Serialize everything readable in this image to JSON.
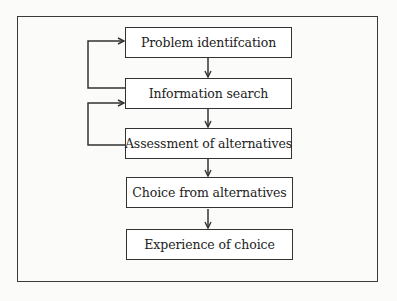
{
  "diagram": {
    "type": "flowchart",
    "steps": [
      {
        "label": "Problem identifcation"
      },
      {
        "label": "Information search"
      },
      {
        "label": "Assessment of alternatives"
      },
      {
        "label": "Choice from alternatives"
      },
      {
        "label": "Experience of choice"
      }
    ],
    "connections": [
      {
        "from": 0,
        "to": 1,
        "type": "forward"
      },
      {
        "from": 1,
        "to": 2,
        "type": "forward"
      },
      {
        "from": 2,
        "to": 3,
        "type": "forward"
      },
      {
        "from": 3,
        "to": 4,
        "type": "forward"
      },
      {
        "from": 1,
        "to": 0,
        "type": "feedback"
      },
      {
        "from": 2,
        "to": 1,
        "type": "feedback"
      }
    ],
    "colors": {
      "line": "#333333",
      "box_fill": "#ffffff",
      "background": "#fbfbf9"
    }
  }
}
